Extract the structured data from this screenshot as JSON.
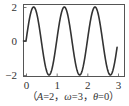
{
  "chart_data": {
    "type": "line",
    "title": "",
    "caption": {
      "open": "（",
      "parts": [
        {
          "var": "A",
          "eq": "=2，"
        },
        {
          "var": "ω",
          "eq": "=3，"
        },
        {
          "var": "θ",
          "eq": "=0"
        }
      ],
      "close": "）"
    },
    "xlabel": "",
    "ylabel": "",
    "xlim": [
      0,
      3
    ],
    "ylim": [
      -2,
      2
    ],
    "xticks": [
      0,
      1,
      2,
      3
    ],
    "xtick_labels": [
      "0",
      "1",
      "2",
      "3"
    ],
    "yticks": [
      2,
      0,
      -2
    ],
    "ytick_labels": [
      "2",
      "0",
      "−2"
    ],
    "grid": false,
    "legend": "none",
    "series": [
      {
        "name": "y = 2 sin(2πt)",
        "amplitude": 2,
        "period": 1,
        "phase": 0,
        "x_range": [
          0,
          2.97
        ],
        "color": "#333333",
        "sample_points": [
          {
            "x": 0,
            "y": 0
          },
          {
            "x": 0.25,
            "y": 2
          },
          {
            "x": 0.5,
            "y": 0
          },
          {
            "x": 0.75,
            "y": -2
          },
          {
            "x": 1.0,
            "y": 0
          },
          {
            "x": 1.25,
            "y": 2
          },
          {
            "x": 1.5,
            "y": 0
          },
          {
            "x": 1.75,
            "y": -2
          },
          {
            "x": 2.0,
            "y": 0
          },
          {
            "x": 2.25,
            "y": 2
          },
          {
            "x": 2.5,
            "y": 0
          },
          {
            "x": 2.75,
            "y": -2
          },
          {
            "x": 2.97,
            "y": -0.38
          }
        ]
      }
    ]
  },
  "colors": {
    "line": "#333333",
    "frame": "#555555",
    "text": "#333333"
  }
}
